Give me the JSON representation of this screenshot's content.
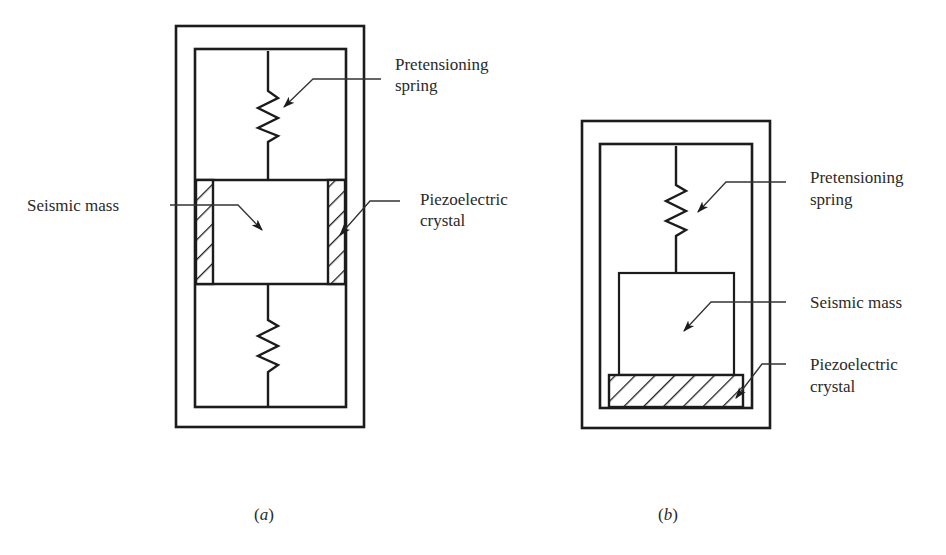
{
  "figure": {
    "panels": [
      {
        "id": "a",
        "caption_letter": "a",
        "labels": {
          "spring": [
            "Pretensioning",
            "spring"
          ],
          "mass": "Seismic mass",
          "crystal": [
            "Piezoelectric",
            "crystal"
          ]
        }
      },
      {
        "id": "b",
        "caption_letter": "b",
        "labels": {
          "spring": [
            "Pretensioning",
            "spring"
          ],
          "mass": "Seismic mass",
          "crystal": [
            "Piezoelectric",
            "crystal"
          ]
        }
      }
    ],
    "colors": {
      "line": "#1c1c1c",
      "text": "#2a2a2a",
      "background": "#ffffff"
    }
  }
}
